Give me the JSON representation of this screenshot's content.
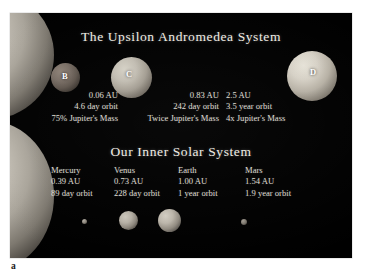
{
  "figure": {
    "caption_label": "a"
  },
  "exo_system": {
    "title": "The Upsilon Andromedea System",
    "star_name": "Upsilon Andromedae",
    "planets": [
      {
        "letter": "B",
        "distance": "0.06 AU",
        "orbit": "4.6 day orbit",
        "mass": "75% Jupiter's Mass"
      },
      {
        "letter": "C",
        "distance": "0.83 AU",
        "orbit": "242 day orbit",
        "mass": "Twice Jupiter's Mass"
      },
      {
        "letter": "D",
        "distance": "2.5 AU",
        "orbit": "3.5 year orbit",
        "mass": "4x Jupiter's Mass"
      }
    ]
  },
  "solar_system": {
    "title": "Our Inner Solar System",
    "planets": [
      {
        "name": "Mercury",
        "distance": "0.39 AU",
        "orbit": "89 day orbit"
      },
      {
        "name": "Venus",
        "distance": "0.73 AU",
        "orbit": "228 day orbit"
      },
      {
        "name": "Earth",
        "distance": "1.00 AU",
        "orbit": "1 year orbit"
      },
      {
        "name": "Mars",
        "distance": "1.54 AU",
        "orbit": "1.9 year orbit"
      }
    ]
  },
  "colors": {
    "background": "#000000",
    "page": "#ffffff",
    "text": "#dedad0",
    "heading": "#efece4",
    "label": "#ffffff"
  }
}
